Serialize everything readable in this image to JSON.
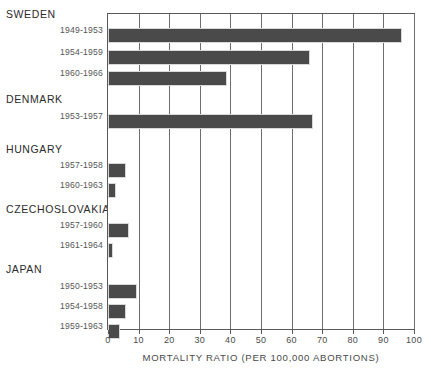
{
  "chart_data": {
    "type": "bar",
    "orientation": "horizontal",
    "title": "",
    "xlabel": "MORTALITY RATIO (PER 100,000 ABORTIONS)",
    "ylabel": "",
    "xlim": [
      0,
      100
    ],
    "xticks": [
      0,
      10,
      20,
      30,
      40,
      50,
      60,
      70,
      80,
      90,
      100
    ],
    "xtick_labels": [
      "0",
      "10",
      "20",
      "30",
      "40",
      "50",
      "60",
      "70",
      "80",
      "90",
      "100"
    ],
    "grid": true,
    "legend": "none",
    "bar_color": "#4a4a4a",
    "groups": [
      {
        "country": "SWEDEN",
        "bars": [
          {
            "period": "1949-1953",
            "value": 96
          },
          {
            "period": "1954-1959",
            "value": 66
          },
          {
            "period": "1960-1966",
            "value": 39
          }
        ]
      },
      {
        "country": "DENMARK",
        "bars": [
          {
            "period": "1953-1957",
            "value": 67
          }
        ]
      },
      {
        "country": "HUNGARY",
        "bars": [
          {
            "period": "1957-1958",
            "value": 6
          },
          {
            "period": "1960-1963",
            "value": 2.5
          }
        ]
      },
      {
        "country": "CZECHOSLOVAKIA",
        "bars": [
          {
            "period": "1957-1960",
            "value": 7
          },
          {
            "period": "1961-1964",
            "value": 1.5
          }
        ]
      },
      {
        "country": "JAPAN",
        "bars": [
          {
            "period": "1950-1953",
            "value": 9.5
          },
          {
            "period": "1954-1958",
            "value": 6
          },
          {
            "period": "1959-1963",
            "value": 4
          }
        ]
      }
    ]
  },
  "labels": {
    "sweden": "SWEDEN",
    "sweden_p1": "1949-1953",
    "sweden_p2": "1954-1959",
    "sweden_p3": "1960-1966",
    "denmark": "DENMARK",
    "denmark_p1": "1953-1957",
    "hungary": "HUNGARY",
    "hungary_p1": "1957-1958",
    "hungary_p2": "1960-1963",
    "czechoslovakia": "CZECHOSLOVAKIA",
    "czechoslovakia_p1": "1957-1960",
    "czechoslovakia_p2": "1961-1964",
    "japan": "JAPAN",
    "japan_p1": "1950-1953",
    "japan_p2": "1954-1958",
    "japan_p3": "1959-1963"
  }
}
